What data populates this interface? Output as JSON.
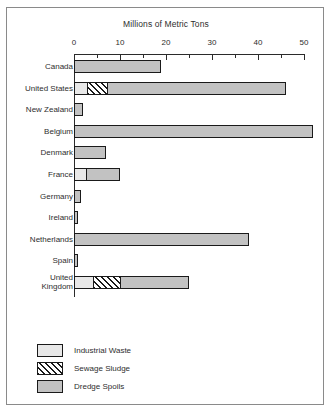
{
  "chart_data": {
    "type": "bar",
    "orientation": "horizontal",
    "title": "Millions of Metric Tons",
    "xlabel": "Millions of Metric Tons",
    "ylabel": "",
    "xlim": [
      0,
      52
    ],
    "xticks": [
      0,
      10,
      20,
      30,
      40,
      50
    ],
    "xtick_labels": [
      "0",
      "10",
      "20",
      "30",
      "40",
      "50"
    ],
    "minor_tick_step": 5,
    "grid": false,
    "legend_position": "bottom-left",
    "stacked": true,
    "categories": [
      "Canada",
      "United States",
      "New Zealand",
      "Belgium",
      "Denmark",
      "France",
      "Germany",
      "Ireland",
      "Netherlands",
      "Spain",
      "United Kingdom"
    ],
    "series": [
      {
        "name": "Industrial Waste",
        "color": "#e8e8e8",
        "pattern": "solid-light",
        "values": [
          0,
          2.7,
          0,
          0,
          0,
          2.5,
          0,
          0,
          0,
          0,
          4.0
        ]
      },
      {
        "name": "Sewage Sludge",
        "color": "#ffffff",
        "pattern": "diagonal-hatch",
        "values": [
          0,
          4.3,
          0,
          0,
          0,
          0,
          0,
          0,
          0,
          0,
          6.0
        ]
      },
      {
        "name": "Dredge Spoils",
        "color": "#c2c2c2",
        "pattern": "solid-gray",
        "values": [
          19.0,
          39.0,
          2.0,
          52.0,
          7.0,
          7.5,
          1.5,
          0.8,
          38.0,
          0.8,
          15.0
        ]
      }
    ],
    "totals": [
      19.0,
      46.0,
      2.0,
      52.0,
      7.0,
      10.0,
      1.5,
      0.8,
      38.0,
      0.8,
      25.0
    ]
  },
  "legend": {
    "items": [
      {
        "label": "Industrial Waste",
        "swatch": "industrial"
      },
      {
        "label": "Sewage Sludge",
        "swatch": "sewage"
      },
      {
        "label": "Dredge Spoils",
        "swatch": "dredge"
      }
    ]
  },
  "colors": {
    "industrial": "#e8e8e8",
    "dredge": "#c2c2c2",
    "outline": "#1a1a1a",
    "frame": "#8a8a8a",
    "text": "#2e2e2e"
  }
}
